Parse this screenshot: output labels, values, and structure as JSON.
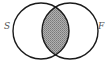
{
  "diagram": {
    "type": "venn",
    "sets": [
      {
        "label": "S",
        "position": "left"
      },
      {
        "label": "F",
        "position": "right"
      }
    ],
    "shaded_region": "intersection",
    "colors": {
      "outline": "#1a1a1a",
      "shade": "#9a9a9a",
      "background": "#ffffff",
      "label": "#555555"
    }
  }
}
